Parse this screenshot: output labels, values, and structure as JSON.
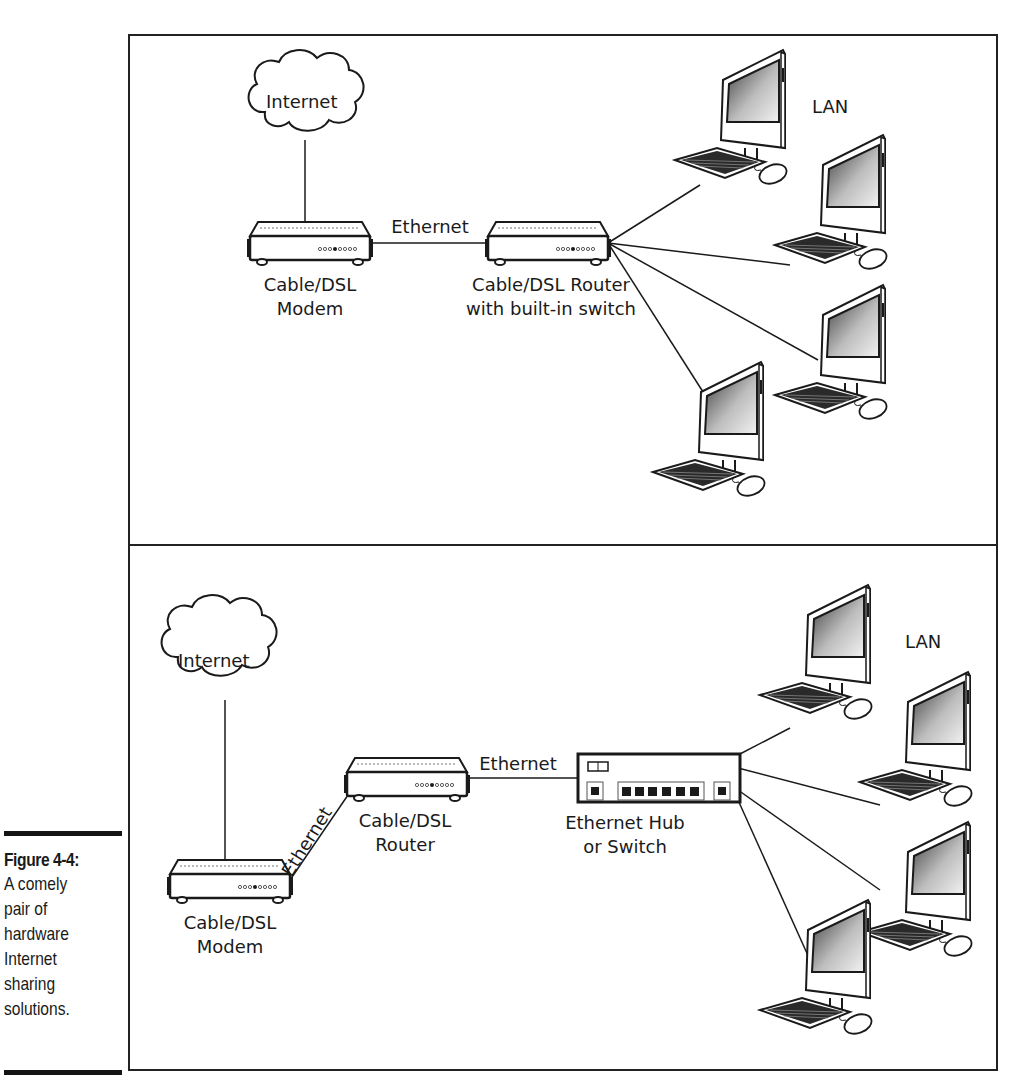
{
  "caption": {
    "title": "Figure 4-4:",
    "lines": [
      "A comely",
      "pair of",
      "hardware",
      "Internet",
      "sharing",
      "solutions."
    ]
  },
  "top_panel": {
    "cloud_label": "Internet",
    "modem_label_1": "Cable/DSL",
    "modem_label_2": "Modem",
    "link_label": "Ethernet",
    "router_label_1": "Cable/DSL Router",
    "router_label_2": "with built-in switch",
    "lan_label": "LAN",
    "computers": 4
  },
  "bottom_panel": {
    "cloud_label": "Internet",
    "modem_label_1": "Cable/DSL",
    "modem_label_2": "Modem",
    "link_label_1": "Ethernet",
    "router_label_1": "Cable/DSL",
    "router_label_2": "Router",
    "link_label_2": "Ethernet",
    "hub_label_1": "Ethernet Hub",
    "hub_label_2": "or Switch",
    "lan_label": "LAN",
    "computers": 4
  },
  "colors": {
    "ink": "#1a1a1a",
    "paper": "#ffffff",
    "screen_dark": "#444444",
    "screen_light": "#eeeeee"
  }
}
